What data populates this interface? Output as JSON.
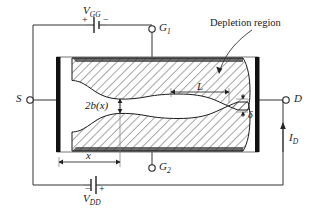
{
  "figure": {
    "type": "jfet-channel-cross-section-diagram"
  },
  "labels": {
    "vgg": "V",
    "vgg_sub": "GG",
    "vdd": "V",
    "vdd_sub": "DD",
    "gate1": "G",
    "gate1_sub": "1",
    "gate2": "G",
    "gate2_sub": "2",
    "source": "S",
    "drain": "D",
    "drain_current": "I",
    "drain_current_sub": "D",
    "channel_width": "2b(x)",
    "position": "x",
    "pinch_length": "L",
    "delta": "δ",
    "depletion_region": "Depletion region"
  },
  "polarity": {
    "vgg_left": "+",
    "vgg_right": "−",
    "vdd_left": "−",
    "vdd_right": "+"
  },
  "colors": {
    "line": "#1a1a1a",
    "contact_bar": "#111111",
    "gate_electrode": "#5a5a5a",
    "hatch": "#333333",
    "background": "#ffffff",
    "body_outline": "#555555"
  },
  "terminals": [
    {
      "name": "G1",
      "position": "top"
    },
    {
      "name": "G2",
      "position": "bottom"
    },
    {
      "name": "S",
      "position": "left"
    },
    {
      "name": "D",
      "position": "right"
    }
  ],
  "dimensions": [
    {
      "name": "2b(x)",
      "orientation": "vertical",
      "meaning": "channel half-width doubled"
    },
    {
      "name": "x",
      "orientation": "horizontal",
      "meaning": "distance from source"
    },
    {
      "name": "L",
      "orientation": "horizontal",
      "meaning": "pinch-off length"
    },
    {
      "name": "δ",
      "orientation": "vertical",
      "meaning": "residual channel opening"
    }
  ]
}
